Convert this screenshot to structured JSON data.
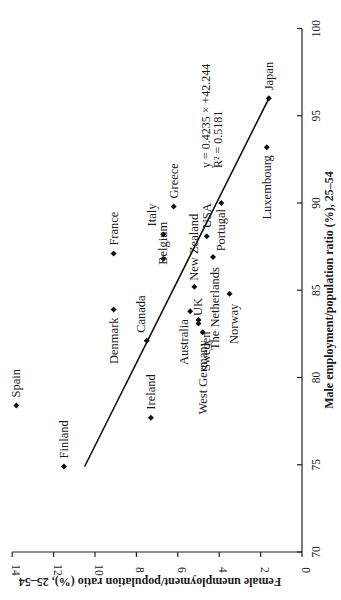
{
  "chart_data": {
    "type": "scatter",
    "orientation": "rotated-90-ccw",
    "title": "",
    "xlabel": "Male employment/population ratio (%), 25–54",
    "ylabel": "Female unemployment/population ratio (%), 25–54",
    "xlim": [
      70,
      100
    ],
    "ylim": [
      0,
      14
    ],
    "x_ticks": [
      "70",
      "75",
      "80",
      "85",
      "90",
      "95",
      "100"
    ],
    "y_ticks": [
      "0",
      "2",
      "4",
      "6",
      "8",
      "10",
      "12",
      "14"
    ],
    "grid": false,
    "legend": null,
    "points": [
      {
        "label": "Spain",
        "x": 78.4,
        "y": 13.8
      },
      {
        "label": "Finland",
        "x": 74.9,
        "y": 11.5
      },
      {
        "label": "Ireland",
        "x": 77.7,
        "y": 7.3
      },
      {
        "label": "Denmark",
        "x": 83.9,
        "y": 9.1
      },
      {
        "label": "Canada",
        "x": 82.1,
        "y": 7.5
      },
      {
        "label": "France",
        "x": 87.1,
        "y": 9.1
      },
      {
        "label": "Belgium",
        "x": 86.8,
        "y": 6.7
      },
      {
        "label": "Italy",
        "x": 88.2,
        "y": 6.7
      },
      {
        "label": "Greece",
        "x": 89.8,
        "y": 6.2
      },
      {
        "label": "New Zealand",
        "x": 85.2,
        "y": 5.2
      },
      {
        "label": "Australia",
        "x": 83.8,
        "y": 5.4
      },
      {
        "label": "UK",
        "x": 83.3,
        "y": 5.0
      },
      {
        "label": "Sweden",
        "x": 83.1,
        "y": 5.0
      },
      {
        "label": "West Germany",
        "x": 82.6,
        "y": 4.8
      },
      {
        "label": "USA",
        "x": 88.1,
        "y": 4.6
      },
      {
        "label": "The Netherlands",
        "x": 86.9,
        "y": 4.3
      },
      {
        "label": "Norway",
        "x": 84.8,
        "y": 3.5
      },
      {
        "label": "Portugal",
        "x": 90.0,
        "y": 3.9
      },
      {
        "label": "Luxembourg",
        "x": 93.2,
        "y": 1.7
      },
      {
        "label": "Japan",
        "x": 96.0,
        "y": 1.6
      }
    ],
    "trendline": {
      "type": "linear",
      "x_range": [
        74.9,
        96.0
      ],
      "equation": "y = 0.4235 × +42.244",
      "r_squared": "R² = 0.5181"
    },
    "annotations": [
      "y = 0.4235 × +42.244",
      "R² = 0.5181"
    ]
  }
}
